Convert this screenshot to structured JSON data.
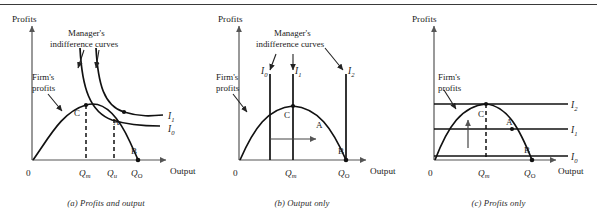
{
  "figure": {
    "rule_top": true,
    "axis_color": "#555555",
    "curve_color": "#111111"
  },
  "panels": [
    {
      "id": "a",
      "caption": "(a) Profits and output",
      "y_axis_label": "Profits",
      "x_axis_label": "Output",
      "origin_label": "0",
      "note_firm": "Firm's",
      "note_firm2": "profits",
      "note_manager": "Manager's",
      "note_manager2": "indifference curves",
      "points": [
        {
          "label": "C"
        },
        {
          "label": "A"
        },
        {
          "label": "B"
        }
      ],
      "curves": [
        {
          "label": "I",
          "sub": "1"
        },
        {
          "label": "I",
          "sub": "0"
        }
      ],
      "xticks": [
        {
          "label": "Q",
          "sub": "m"
        },
        {
          "label": "Q",
          "sub": "u"
        },
        {
          "label": "Q",
          "sub": "O"
        }
      ]
    },
    {
      "id": "b",
      "caption": "(b) Output only",
      "y_axis_label": "Profits",
      "x_axis_label": "Output",
      "origin_label": "0",
      "note_firm": "Firm's",
      "note_firm2": "profits",
      "note_manager": "Manager's",
      "note_manager2": "indifference curves",
      "points": [
        {
          "label": "C"
        },
        {
          "label": "A"
        },
        {
          "label": "B"
        }
      ],
      "curves": [
        {
          "label": "I",
          "sub": "0"
        },
        {
          "label": "I",
          "sub": "1"
        },
        {
          "label": "I",
          "sub": "2"
        }
      ],
      "xticks": [
        {
          "label": "Q",
          "sub": "m"
        },
        {
          "label": "Q",
          "sub": "O"
        }
      ]
    },
    {
      "id": "c",
      "caption": "(c) Profits only",
      "y_axis_label": "Profits",
      "x_axis_label": "Output",
      "origin_label": "0",
      "note_firm": "Firm's",
      "note_firm2": "profits",
      "points": [
        {
          "label": "C"
        },
        {
          "label": "A"
        },
        {
          "label": "B"
        }
      ],
      "curves": [
        {
          "label": "I",
          "sub": "2"
        },
        {
          "label": "I",
          "sub": "1"
        },
        {
          "label": "I",
          "sub": "0"
        }
      ],
      "xticks": [
        {
          "label": "Q",
          "sub": "m"
        },
        {
          "label": "Q",
          "sub": "O"
        }
      ]
    }
  ]
}
